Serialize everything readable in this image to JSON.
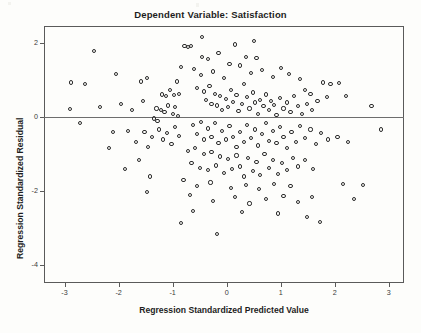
{
  "chart_data": {
    "type": "scatter",
    "title": "Dependent Variable: Satisfaction",
    "xlabel": "Regression Standardized Predicted Value",
    "ylabel": "Regression Standardized Residual",
    "xlim": [
      -3.38,
      3.28
    ],
    "ylim": [
      -4.5,
      2.45
    ],
    "xticks": [
      -3,
      -2,
      -1,
      0,
      1,
      2,
      3
    ],
    "xticklabels": [
      "-3",
      "-2",
      "-1",
      "0",
      "1",
      "2",
      "3"
    ],
    "yticks": [
      2,
      0,
      -2,
      -4
    ],
    "yticklabels": [
      "2",
      "0",
      "-2",
      "-4"
    ],
    "grid": false,
    "legend": null,
    "reference_line": {
      "axis": "horizontal",
      "value": 0
    },
    "marker": "open-circle",
    "n_points": 201,
    "points": [
      [
        -2.45,
        1.78
      ],
      [
        -2.88,
        0.92
      ],
      [
        -2.62,
        0.88
      ],
      [
        -2.9,
        0.2
      ],
      [
        -2.72,
        -0.18
      ],
      [
        -2.1,
        -0.42
      ],
      [
        -1.55,
        0.42
      ],
      [
        -1.62,
        -1.18
      ],
      [
        -1.48,
        1.05
      ],
      [
        -1.2,
        0.6
      ],
      [
        -1.12,
        0.55
      ],
      [
        -1.05,
        0.72
      ],
      [
        -0.98,
        0.58
      ],
      [
        -0.92,
        0.95
      ],
      [
        -0.88,
        0.62
      ],
      [
        -1.3,
        0.22
      ],
      [
        -1.22,
        0.18
      ],
      [
        -1.15,
        0.12
      ],
      [
        -1.08,
        0.3
      ],
      [
        -1.0,
        0.08
      ],
      [
        -0.95,
        0.25
      ],
      [
        -0.9,
        0.02
      ],
      [
        -1.35,
        -0.05
      ],
      [
        -1.28,
        -0.12
      ],
      [
        -0.85,
        1.35
      ],
      [
        -0.78,
        1.92
      ],
      [
        -0.72,
        1.88
      ],
      [
        -0.66,
        1.9
      ],
      [
        -0.6,
        1.28
      ],
      [
        -0.55,
        0.78
      ],
      [
        -0.48,
        1.12
      ],
      [
        -0.42,
        0.68
      ],
      [
        -0.38,
        0.45
      ],
      [
        -0.32,
        0.82
      ],
      [
        -0.28,
        0.35
      ],
      [
        -0.22,
        0.62
      ],
      [
        -0.18,
        0.3
      ],
      [
        -0.12,
        0.55
      ],
      [
        -0.08,
        0.18
      ],
      [
        -0.02,
        0.48
      ],
      [
        0.02,
        0.25
      ],
      [
        0.08,
        0.72
      ],
      [
        0.12,
        0.4
      ],
      [
        0.18,
        0.58
      ],
      [
        0.22,
        0.15
      ],
      [
        0.28,
        0.35
      ],
      [
        0.32,
        0.88
      ],
      [
        0.38,
        0.52
      ],
      [
        0.42,
        0.22
      ],
      [
        0.48,
        0.65
      ],
      [
        0.52,
        0.38
      ],
      [
        0.58,
        0.08
      ],
      [
        0.62,
        0.45
      ],
      [
        0.68,
        0.28
      ],
      [
        0.72,
        0.6
      ],
      [
        0.78,
        0.18
      ],
      [
        0.82,
        0.42
      ],
      [
        0.88,
        0.32
      ],
      [
        0.92,
        0.05
      ],
      [
        0.98,
        0.5
      ],
      [
        1.05,
        0.22
      ],
      [
        1.12,
        0.38
      ],
      [
        1.18,
        0.12
      ],
      [
        1.25,
        0.55
      ],
      [
        1.32,
        0.28
      ],
      [
        1.4,
        0.08
      ],
      [
        1.48,
        0.35
      ],
      [
        1.58,
        0.18
      ],
      [
        1.68,
        0.42
      ],
      [
        1.78,
        0.92
      ],
      [
        1.92,
        0.88
      ],
      [
        2.08,
        0.9
      ],
      [
        1.85,
        0.52
      ],
      [
        2.2,
        0.55
      ],
      [
        -0.45,
        1.62
      ],
      [
        -0.35,
        1.55
      ],
      [
        0.05,
        1.42
      ],
      [
        0.15,
        1.95
      ],
      [
        0.25,
        1.38
      ],
      [
        0.45,
        1.18
      ],
      [
        0.65,
        1.25
      ],
      [
        0.85,
        1.08
      ],
      [
        1.0,
        1.32
      ],
      [
        1.15,
        1.15
      ],
      [
        1.35,
        1.02
      ],
      [
        0.55,
        1.58
      ],
      [
        -0.25,
        1.22
      ],
      [
        -0.15,
        1.72
      ],
      [
        1.45,
        0.72
      ],
      [
        1.55,
        0.62
      ],
      [
        -0.05,
        1.05
      ],
      [
        0.35,
        1.62
      ],
      [
        -0.62,
        -0.22
      ],
      [
        -0.55,
        -0.48
      ],
      [
        -0.48,
        -0.15
      ],
      [
        -0.42,
        -0.62
      ],
      [
        -0.35,
        -0.32
      ],
      [
        -0.28,
        -0.55
      ],
      [
        -0.22,
        -0.18
      ],
      [
        -0.15,
        -0.72
      ],
      [
        -0.08,
        -0.38
      ],
      [
        -0.02,
        -0.62
      ],
      [
        0.05,
        -0.25
      ],
      [
        0.12,
        -0.55
      ],
      [
        0.18,
        -0.82
      ],
      [
        0.25,
        -0.42
      ],
      [
        0.32,
        -0.68
      ],
      [
        0.38,
        -0.22
      ],
      [
        0.45,
        -0.58
      ],
      [
        0.52,
        -0.35
      ],
      [
        0.58,
        -0.78
      ],
      [
        0.65,
        -0.48
      ],
      [
        0.72,
        -0.18
      ],
      [
        0.78,
        -0.65
      ],
      [
        0.85,
        -0.38
      ],
      [
        0.92,
        -0.72
      ],
      [
        0.98,
        -0.28
      ],
      [
        1.05,
        -0.55
      ],
      [
        1.12,
        -0.85
      ],
      [
        1.2,
        -0.42
      ],
      [
        1.28,
        -0.68
      ],
      [
        1.35,
        -0.25
      ],
      [
        1.45,
        -0.58
      ],
      [
        1.55,
        -0.35
      ],
      [
        1.65,
        -0.75
      ],
      [
        1.75,
        -0.45
      ],
      [
        1.88,
        -0.62
      ],
      [
        2.05,
        -0.55
      ],
      [
        2.25,
        -0.68
      ],
      [
        -0.72,
        -0.92
      ],
      [
        -0.65,
        -1.25
      ],
      [
        -0.58,
        -0.85
      ],
      [
        -0.5,
        -1.38
      ],
      [
        -0.42,
        -1.02
      ],
      [
        -0.35,
        -1.45
      ],
      [
        -0.28,
        -0.95
      ],
      [
        -0.2,
        -1.32
      ],
      [
        -0.12,
        -1.08
      ],
      [
        -0.05,
        -1.52
      ],
      [
        0.02,
        -1.15
      ],
      [
        0.1,
        -1.42
      ],
      [
        0.18,
        -1.05
      ],
      [
        0.25,
        -1.35
      ],
      [
        0.32,
        -1.62
      ],
      [
        0.4,
        -1.12
      ],
      [
        0.48,
        -1.48
      ],
      [
        0.55,
        -1.22
      ],
      [
        0.62,
        -1.58
      ],
      [
        0.7,
        -1.02
      ],
      [
        0.78,
        -1.38
      ],
      [
        0.85,
        -1.18
      ],
      [
        0.95,
        -1.55
      ],
      [
        1.02,
        -1.25
      ],
      [
        1.12,
        -1.45
      ],
      [
        1.22,
        -1.12
      ],
      [
        1.32,
        -1.35
      ],
      [
        1.45,
        -1.18
      ],
      [
        1.6,
        -1.42
      ],
      [
        -0.88,
        -0.52
      ],
      [
        -0.95,
        -0.28
      ],
      [
        -1.02,
        -0.75
      ],
      [
        -1.1,
        -0.45
      ],
      [
        -1.18,
        -0.62
      ],
      [
        -1.25,
        -0.35
      ],
      [
        -1.38,
        -0.55
      ],
      [
        -1.45,
        -0.82
      ],
      [
        -1.52,
        -0.42
      ],
      [
        -1.68,
        -0.68
      ],
      [
        -1.82,
        -0.38
      ],
      [
        -0.8,
        -1.72
      ],
      [
        -0.55,
        -1.88
      ],
      [
        -0.3,
        -1.78
      ],
      [
        0.08,
        -1.92
      ],
      [
        0.35,
        -1.85
      ],
      [
        0.6,
        -1.95
      ],
      [
        0.88,
        -1.82
      ],
      [
        1.18,
        -1.88
      ],
      [
        -1.42,
        -1.62
      ],
      [
        -0.68,
        -2.12
      ],
      [
        -0.25,
        -2.28
      ],
      [
        0.15,
        -2.18
      ],
      [
        0.42,
        -2.35
      ],
      [
        0.72,
        -2.22
      ],
      [
        1.05,
        -2.15
      ],
      [
        1.32,
        -2.32
      ],
      [
        1.58,
        -2.18
      ],
      [
        2.15,
        -1.82
      ],
      [
        2.52,
        -1.85
      ],
      [
        -0.62,
        -2.55
      ],
      [
        0.28,
        -2.58
      ],
      [
        0.95,
        -2.62
      ],
      [
        1.48,
        -2.72
      ],
      [
        -0.18,
        -3.18
      ],
      [
        -0.85,
        -2.88
      ],
      [
        1.72,
        -2.85
      ],
      [
        2.35,
        -2.22
      ],
      [
        -2.35,
        0.25
      ],
      [
        -2.05,
        1.15
      ],
      [
        -1.95,
        0.35
      ],
      [
        -1.75,
        0.18
      ],
      [
        -1.58,
        0.95
      ],
      [
        -1.48,
        -2.05
      ],
      [
        -2.18,
        -0.85
      ],
      [
        -1.88,
        -1.42
      ],
      [
        2.68,
        0.28
      ],
      [
        2.85,
        -0.35
      ],
      [
        -0.45,
        2.15
      ],
      [
        0.5,
        2.05
      ]
    ]
  }
}
